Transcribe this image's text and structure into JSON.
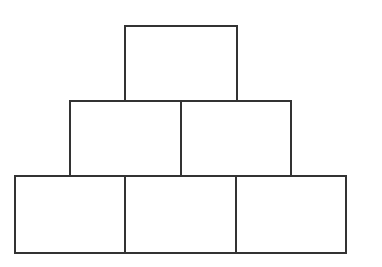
{
  "diagram": {
    "type": "brick-pyramid",
    "rows": [
      {
        "row": 1,
        "count": 1,
        "bricks": [
          {
            "x": 124,
            "y": 25,
            "w": 114,
            "h": 78
          }
        ]
      },
      {
        "row": 2,
        "count": 2,
        "bricks": [
          {
            "x": 69,
            "y": 100,
            "w": 114,
            "h": 78
          },
          {
            "x": 180,
            "y": 100,
            "w": 112,
            "h": 78
          }
        ]
      },
      {
        "row": 3,
        "count": 3,
        "bricks": [
          {
            "x": 14,
            "y": 175,
            "w": 114,
            "h": 79
          },
          {
            "x": 124,
            "y": 175,
            "w": 114,
            "h": 79
          },
          {
            "x": 235,
            "y": 175,
            "w": 112,
            "h": 79
          }
        ]
      }
    ],
    "stroke_color": "#333333",
    "fill_color": "#ffffff"
  }
}
